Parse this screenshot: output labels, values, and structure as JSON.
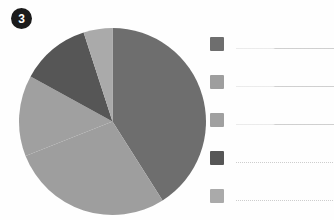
{
  "slide": {
    "step_number": "3",
    "background_color": "#fefefe"
  },
  "chart_data": {
    "type": "pie",
    "title": "",
    "subtitle": "",
    "xlabel": "",
    "ylabel": "",
    "grid": false,
    "legend_position": "right",
    "center": [
      112,
      121
    ],
    "radius": 94,
    "start_angle_deg": 0,
    "direction": "clockwise",
    "categories": [
      "Series 1",
      "Series 2",
      "Series 3",
      "Series 4",
      "Series 5"
    ],
    "labels": [
      "",
      "",
      "",
      "",
      ""
    ],
    "values": [
      41,
      28,
      14,
      12,
      5
    ],
    "percentages": [
      41,
      28,
      14,
      12,
      5
    ],
    "colors": [
      "#6e6e6e",
      "#9e9e9e",
      "#a0a0a0",
      "#565656",
      "#aaaaaa"
    ],
    "slices": [
      {
        "name": "slice-1",
        "value": 41,
        "percent": 41,
        "color": "#6e6e6e",
        "start_deg": 0,
        "end_deg": 147.6
      },
      {
        "name": "slice-2",
        "value": 28,
        "percent": 28,
        "color": "#9e9e9e",
        "start_deg": 147.6,
        "end_deg": 248.4
      },
      {
        "name": "slice-3",
        "value": 14,
        "percent": 14,
        "color": "#a0a0a0",
        "start_deg": 248.4,
        "end_deg": 298.8
      },
      {
        "name": "slice-4",
        "value": 12,
        "percent": 12,
        "color": "#565656",
        "start_deg": 298.8,
        "end_deg": 342.0
      },
      {
        "name": "slice-5",
        "value": 5,
        "percent": 5,
        "color": "#aaaaaa",
        "start_deg": 342.0,
        "end_deg": 360.0
      }
    ]
  },
  "legend": {
    "items": [
      {
        "swatch_color": "#6e6e6e",
        "label": "",
        "placeholder": ""
      },
      {
        "swatch_color": "#9e9e9e",
        "label": "",
        "placeholder": ""
      },
      {
        "swatch_color": "#a0a0a0",
        "label": "",
        "placeholder": ""
      },
      {
        "swatch_color": "#565656",
        "label": "",
        "placeholder": ""
      },
      {
        "swatch_color": "#aaaaaa",
        "label": "",
        "placeholder": ""
      }
    ]
  }
}
